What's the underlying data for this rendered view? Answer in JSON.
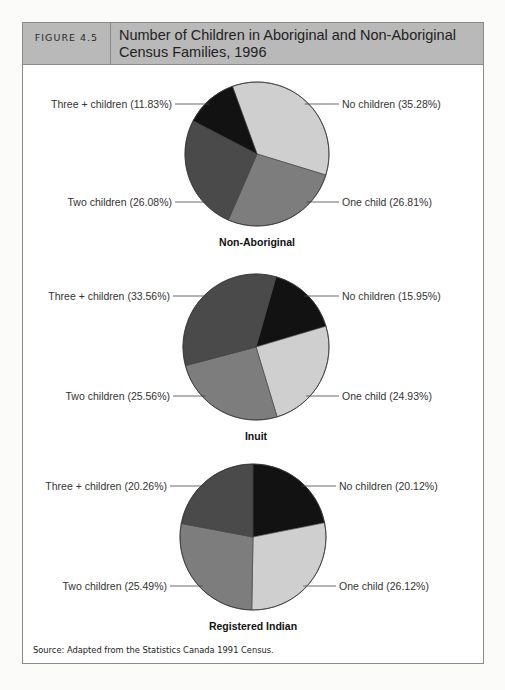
{
  "figure": {
    "label": "FIGURE 4.5",
    "title_line1": "Number of Children in Aboriginal and Non-Aboriginal",
    "title_line2": "Census Families, 1996",
    "source": "Source: Adapted from the Statistics Canada 1991 Census."
  },
  "chart_data": [
    {
      "type": "pie",
      "title": "Non-Aboriginal",
      "categories": [
        "No children",
        "One child",
        "Two children",
        "Three + children"
      ],
      "values": [
        35.28,
        26.81,
        26.08,
        11.83
      ],
      "labels": [
        "No children (35.28%)",
        "One child (26.81%)",
        "Two children (26.08%)",
        "Three + children (11.83%)"
      ],
      "colors": [
        "#cfcfcf",
        "#7d7d7d",
        "#4a4a4a",
        "#121212"
      ],
      "start_angle_deg": -20,
      "center": [
        257,
        154
      ],
      "radius": 72
    },
    {
      "type": "pie",
      "title": "Inuit",
      "categories": [
        "No children",
        "One child",
        "Two children",
        "Three + children"
      ],
      "values": [
        15.95,
        24.93,
        25.56,
        33.56
      ],
      "labels": [
        "No children (15.95%)",
        "One child (24.93%)",
        "Two children (25.56%)",
        "Three + children (33.56%)"
      ],
      "colors": [
        "#121212",
        "#cfcfcf",
        "#7d7d7d",
        "#4a4a4a"
      ],
      "start_angle_deg": 16,
      "center": [
        256,
        347
      ],
      "radius": 73
    },
    {
      "type": "pie",
      "title": "Registered Indian",
      "categories": [
        "No children",
        "One child",
        "Two children",
        "Three + children"
      ],
      "values": [
        20.12,
        26.12,
        25.49,
        20.26
      ],
      "labels": [
        "No children (20.12%)",
        "One child (26.12%)",
        "Two children (25.49%)",
        "Three + children (20.26%)"
      ],
      "colors": [
        "#121212",
        "#cfcfcf",
        "#7d7d7d",
        "#4a4a4a"
      ],
      "start_angle_deg": 0,
      "center": [
        253,
        537
      ],
      "radius": 73
    }
  ]
}
